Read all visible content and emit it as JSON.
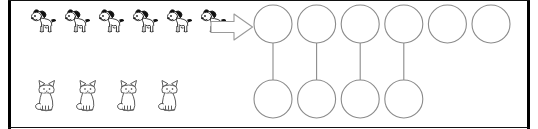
{
  "worksheet": {
    "title": "One-to-one matching worksheet",
    "background_color": "#ffffff",
    "frame_color": "#000000",
    "stroke_color": "#8b8b8b",
    "width": 538,
    "height": 129
  },
  "rows": [
    {
      "id": "dogs-row",
      "label": "Dogs row",
      "animal": "dog",
      "animal_icon": "dog-icon",
      "count": 6,
      "arrow_label": "right-arrow",
      "arrow_icon": "block-arrow-right-icon",
      "circles": 6,
      "matched_circles": 4,
      "unmatched_circles": 2
    },
    {
      "id": "cats-row",
      "label": "Cats row",
      "animal": "cat",
      "animal_icon": "cat-icon",
      "count": 4,
      "arrow_label": "right-arrow",
      "arrow_icon": "block-arrow-right-icon",
      "circles": 4,
      "matched_circles": 4,
      "unmatched_circles": 0
    }
  ],
  "connectors": {
    "label": "matching lines",
    "count": 4
  },
  "chart_data": {
    "type": "bar",
    "categories": [
      "dogs",
      "cats"
    ],
    "values": [
      6,
      4
    ],
    "xlabel": "",
    "ylabel": "count",
    "ylim": [
      0,
      6
    ],
    "annotations": [
      "6 dogs",
      "4 cats",
      "4 matched pairs",
      "2 extra dogs"
    ]
  },
  "geometry": {
    "circle_radius": 19,
    "circle_spacing": 43.6,
    "first_circle_center_x": 273,
    "top_row_center_y": 24,
    "bottom_row_center_y": 99
  }
}
